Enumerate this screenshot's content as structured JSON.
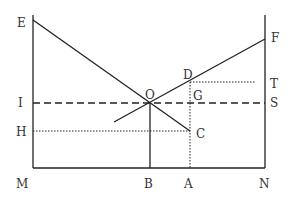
{
  "diagram": {
    "type": "economics-geometric-diagram",
    "colors": {
      "line": "#222222",
      "label": "#333333",
      "background": "#ffffff"
    },
    "labels": {
      "E": "E",
      "F": "F",
      "D": "D",
      "T": "T",
      "O": "O",
      "G": "G",
      "I": "I",
      "S": "S",
      "H": "H",
      "C": "C",
      "M": "M",
      "B": "B",
      "A": "A",
      "N": "N"
    },
    "points": {
      "E": [
        33,
        20
      ],
      "F": [
        265,
        39
      ],
      "D": [
        190,
        82
      ],
      "O": [
        150,
        103
      ],
      "C": [
        190,
        131
      ],
      "M": [
        33,
        168
      ],
      "N": [
        265,
        168
      ],
      "B": [
        150,
        168
      ],
      "A": [
        190,
        168
      ]
    },
    "lines": [
      {
        "name": "left-axis",
        "from": "M-top",
        "style": "solid"
      },
      {
        "name": "right-axis",
        "style": "solid"
      },
      {
        "name": "base-line-MN",
        "style": "solid"
      },
      {
        "name": "line-EC",
        "style": "solid"
      },
      {
        "name": "line-F-lower",
        "style": "solid"
      },
      {
        "name": "dashed-IS",
        "style": "dashed"
      },
      {
        "name": "dotted-DT",
        "style": "dotted"
      },
      {
        "name": "dotted-HC",
        "style": "dotted"
      },
      {
        "name": "dotted-DA",
        "style": "dotted"
      },
      {
        "name": "solid-OB",
        "style": "solid"
      }
    ]
  }
}
